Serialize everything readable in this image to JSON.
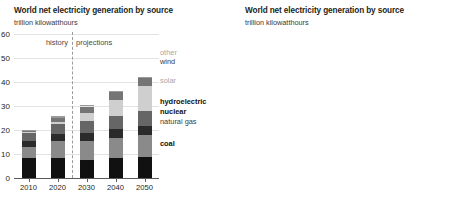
{
  "left": {
    "title": "World net electricity generation by source",
    "subtitle": "trillion kilowatthours",
    "period_labels": {
      "history": "history",
      "projections": "projections"
    },
    "legend": [
      {
        "key": "other",
        "label": "other",
        "weight": "light"
      },
      {
        "key": "wind",
        "label": "wind",
        "weight": "mid"
      },
      {
        "key": "solar",
        "label": "solar",
        "weight": "light"
      },
      {
        "key": "hydroelectric",
        "label": "hydroelectric",
        "weight": "bold"
      },
      {
        "key": "nuclear",
        "label": "nuclear",
        "weight": "bold"
      },
      {
        "key": "natural_gas",
        "label": "natural gas",
        "weight": "mid"
      },
      {
        "key": "coal",
        "label": "coal",
        "weight": "bold"
      }
    ],
    "chart_data": {
      "type": "bar",
      "title": "World net electricity generation by source",
      "subtitle": "trillion kilowatthours",
      "xlabel": "",
      "ylabel": "trillion kilowatthours",
      "ylim": [
        0,
        60
      ],
      "yticks": [
        0,
        10,
        20,
        30,
        40,
        50,
        60
      ],
      "grid": true,
      "stacked": true,
      "legend_position": "right",
      "divider_between": [
        "2020",
        "2030"
      ],
      "categories": [
        "2010",
        "2020",
        "2030",
        "2040",
        "2050"
      ],
      "series": [
        {
          "name": "coal",
          "color": "#111111",
          "values": [
            8.3,
            8.5,
            7.6,
            8.2,
            8.6
          ]
        },
        {
          "name": "natural gas",
          "color": "#8a8a8a",
          "values": [
            4.5,
            6.9,
            7.9,
            8.6,
            9.2
          ]
        },
        {
          "name": "nuclear",
          "color": "#2b2b2b",
          "values": [
            2.7,
            2.8,
            3.3,
            3.6,
            3.9
          ]
        },
        {
          "name": "hydroelectric",
          "color": "#666666",
          "values": [
            3.4,
            4.2,
            4.9,
            5.6,
            6.3
          ]
        },
        {
          "name": "solar",
          "color": "#cfcfcf",
          "values": [
            0.1,
            1.0,
            3.2,
            6.6,
            10.4
          ]
        },
        {
          "name": "wind",
          "color": "#757575",
          "values": [
            0.4,
            1.8,
            2.9,
            3.3,
            3.4
          ]
        },
        {
          "name": "other",
          "color": "#9a9a9a",
          "values": [
            0.7,
            0.6,
            0.5,
            0.5,
            0.5
          ]
        }
      ],
      "totals": [
        20.1,
        25.8,
        30.3,
        36.4,
        42.3
      ]
    }
  },
  "right": {
    "title": "World net electricity generation by source",
    "subtitle": "trillion kilowatthours",
    "period_labels": {
      "history": "history",
      "projections": "projections"
    },
    "legend": [
      {
        "key": "solar",
        "label": "solar",
        "weight": "light"
      },
      {
        "key": "coal",
        "label": "coal",
        "weight": "bold"
      },
      {
        "key": "natural_gas",
        "label": "natural gas",
        "weight": "mid"
      },
      {
        "key": "wind",
        "label": "wind",
        "weight": "mid"
      },
      {
        "key": "hydroelectric",
        "label": "hydroelectric",
        "weight": "bold"
      },
      {
        "key": "nuclear",
        "label": "nuclear",
        "weight": "bold"
      },
      {
        "key": "other",
        "label": "other",
        "weight": "light"
      }
    ],
    "chart_data": {
      "type": "line",
      "title": "World net electricity generation by source",
      "subtitle": "trillion kilowatthours",
      "xlabel": "",
      "ylabel": "trillion kilowatthours",
      "xlim": [
        2010,
        2050
      ],
      "ylim": [
        0,
        12
      ],
      "yticks": [
        0,
        2,
        4,
        6,
        8,
        10,
        12
      ],
      "xticks": [
        2010,
        2020,
        2030,
        2040,
        2050
      ],
      "grid": true,
      "legend_position": "right",
      "divider_at": 2020,
      "x": [
        2010,
        2011,
        2012,
        2013,
        2014,
        2015,
        2016,
        2017,
        2018,
        2019,
        2020,
        2022,
        2025,
        2030,
        2035,
        2040,
        2045,
        2050
      ],
      "series": [
        {
          "name": "coal",
          "color": "#111111",
          "width": 1.6,
          "values": [
            8.1,
            8.6,
            8.5,
            8.9,
            9.0,
            8.8,
            8.7,
            9.0,
            9.2,
            8.9,
            8.0,
            8.3,
            7.9,
            7.6,
            7.9,
            8.2,
            8.4,
            8.6
          ]
        },
        {
          "name": "natural gas",
          "color": "#8a8a8a",
          "width": 1.4,
          "values": [
            4.6,
            4.7,
            4.9,
            5.0,
            5.1,
            5.3,
            5.6,
            5.7,
            6.0,
            6.3,
            6.5,
            6.8,
            7.1,
            7.4,
            7.5,
            7.6,
            7.8,
            8.0
          ]
        },
        {
          "name": "hydroelectric",
          "color": "#1f1f1f",
          "width": 1.5,
          "values": [
            3.4,
            3.6,
            3.8,
            3.9,
            3.9,
            4.0,
            4.1,
            4.1,
            4.3,
            4.2,
            4.2,
            4.4,
            4.6,
            4.9,
            5.2,
            5.5,
            5.8,
            6.1
          ]
        },
        {
          "name": "wind",
          "color": "#8f8f8f",
          "width": 1.4,
          "values": [
            0.4,
            0.5,
            0.6,
            0.7,
            0.8,
            0.9,
            1.0,
            1.2,
            1.3,
            1.5,
            1.8,
            2.2,
            2.8,
            3.6,
            4.5,
            5.2,
            6.0,
            6.9
          ]
        },
        {
          "name": "nuclear",
          "color": "#1f1f1f",
          "width": 1.5,
          "values": [
            2.7,
            2.5,
            2.4,
            2.5,
            2.6,
            2.6,
            2.7,
            2.7,
            2.8,
            2.8,
            2.8,
            2.9,
            3.0,
            3.2,
            3.4,
            3.5,
            3.6,
            3.6
          ]
        },
        {
          "name": "solar",
          "color": "#c4c4c4",
          "width": 1.6,
          "values": [
            0.1,
            0.2,
            0.3,
            0.4,
            0.5,
            0.6,
            0.8,
            1.0,
            1.2,
            1.4,
            1.6,
            2.3,
            3.4,
            5.2,
            7.0,
            8.7,
            10.0,
            11.2
          ]
        },
        {
          "name": "other",
          "color": "#b5b5b5",
          "width": 1.4,
          "values": [
            1.3,
            1.3,
            1.3,
            1.3,
            1.2,
            1.2,
            1.2,
            1.2,
            1.2,
            1.2,
            1.1,
            1.0,
            0.95,
            0.9,
            0.9,
            0.95,
            1.0,
            1.0
          ]
        }
      ]
    }
  }
}
